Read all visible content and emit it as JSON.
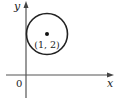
{
  "diagram": {
    "type": "coordinate-plane",
    "axes": {
      "x_label": "x",
      "y_label": "y",
      "origin_label": "0"
    },
    "circle": {
      "center_label": "(1, 2)",
      "center": [
        1,
        2
      ],
      "radius": 1
    },
    "colors": {
      "stroke": "#222222",
      "axis": "#555555",
      "background": "#ffffff"
    }
  }
}
